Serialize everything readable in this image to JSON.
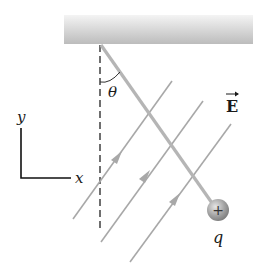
{
  "diagram": {
    "labels": {
      "theta": "θ",
      "field": "E",
      "charge": "q",
      "charge_sign": "+",
      "axis_x": "x",
      "axis_y": "y"
    },
    "elements": {
      "ceiling": {
        "x": 64,
        "y": 15,
        "width": 189,
        "height": 29
      },
      "pivot": {
        "x": 100,
        "y": 44
      },
      "charge_center": {
        "x": 217,
        "y": 210,
        "r": 11
      },
      "field_lines_count": 4
    },
    "colors": {
      "ceiling_top": "#f0f0f0",
      "ceiling_bottom": "#bdbdbd",
      "string": "#b5b5b5",
      "field_line": "#a8a8a8",
      "charge": "#9a9a9a",
      "ink": "#1a1a1a"
    }
  }
}
